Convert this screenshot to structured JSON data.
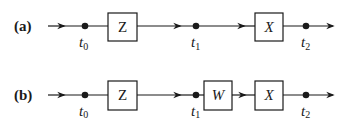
{
  "diagram": {
    "rows": [
      {
        "label": "(a)",
        "blocks": [
          "Z",
          "X"
        ],
        "points": [
          {
            "name": "t",
            "sub": "0"
          },
          {
            "name": "t",
            "sub": "1"
          },
          {
            "name": "t",
            "sub": "2"
          }
        ]
      },
      {
        "label": "(b)",
        "blocks": [
          "Z",
          "W",
          "X"
        ],
        "points": [
          {
            "name": "t",
            "sub": "0"
          },
          {
            "name": "t",
            "sub": "1"
          },
          {
            "name": "t",
            "sub": "2"
          }
        ]
      }
    ],
    "colors": {
      "stroke": "#1a1a1a",
      "background": "#ffffff"
    }
  }
}
